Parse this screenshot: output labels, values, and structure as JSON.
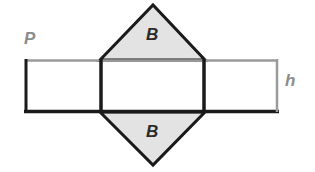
{
  "figure": {
    "background_color": "#ffffff",
    "width": 315,
    "height": 172
  },
  "labels": {
    "perimeter": "P",
    "height": "h",
    "base_top": "B",
    "base_bottom": "B"
  },
  "colors": {
    "triangle_fill": "#e3e3e3",
    "outline_dark": "#1a1a1a",
    "outline_light": "#9a9a9a",
    "label_dim": "#8c8c8c",
    "label_face": "#2b2b2b",
    "rectangle_fill": "#ffffff"
  },
  "shapes": {
    "lateral_rectangle": {
      "name": "lateral-surface-rectangle",
      "x": 25,
      "y": 60,
      "width": 253,
      "height": 52,
      "fill": "#ffffff"
    },
    "fold_lines": {
      "name": "fold-lines",
      "x_left": 100,
      "x_right": 205,
      "y_top": 60,
      "y_bottom": 112
    },
    "triangle_top": {
      "name": "base-triangle-top",
      "points": "100,60 153,5 205,60",
      "fill": "#e3e3e3"
    },
    "triangle_bottom": {
      "name": "base-triangle-bottom",
      "points": "100,112 153,165 205,112",
      "fill": "#e3e3e3"
    }
  }
}
